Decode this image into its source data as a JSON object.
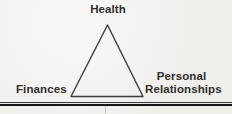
{
  "figure": {
    "type": "triangle-diagram",
    "nodes": [
      {
        "id": "health",
        "label": "Health",
        "position": "top"
      },
      {
        "id": "finances",
        "label": "Finances",
        "position": "bottom-left"
      },
      {
        "id": "personal-relationships",
        "label": "Personal Relationships",
        "position": "bottom-right"
      }
    ],
    "colors": {
      "background": "#f3f2ef",
      "ink": "#2e2e2e",
      "triangle_stroke": "#3c3c3c",
      "rule": "#1a1a1a"
    }
  }
}
